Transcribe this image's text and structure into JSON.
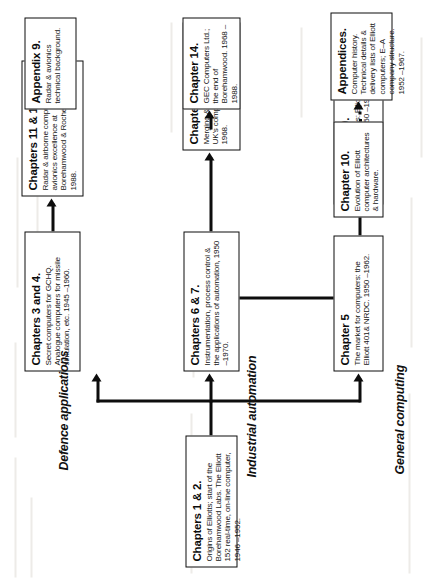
{
  "diagram": {
    "orientation": "rotated-90-ccw",
    "root": {
      "title": "Chapters 1 & 2.",
      "body": "Origins of Elliotts; start of the Borehamwood Labs. The Elliott 152 real-time, on-line computer, 1946 –1952."
    },
    "branches": [
      {
        "key": "defence",
        "label": "Defence applications"
      },
      {
        "key": "industrial",
        "label": "Industrial automation"
      },
      {
        "key": "general",
        "label": "General computing"
      }
    ],
    "boxes": {
      "ch3_4": {
        "title": "Chapters 3 and 4.",
        "body": "Secret computers for GCHQ. Analogue computers for missile simulation, etc. 1945 –1960."
      },
      "ch11_12": {
        "title": "Chapters 11 & 12.",
        "body": "Radar & airborne computing; avionics excellence at Borehamwood & Rochester. 1950 –1988."
      },
      "appendix9": {
        "title": "Appendix 9.",
        "body": "Radar & avionics technical background."
      },
      "ch6_7": {
        "title": "Chapters 6 & 7.",
        "body": "Instrumentation, process control & the applications of automation, 1950 –1970."
      },
      "ch13": {
        "title": "Chapter 13.",
        "body": "Merging & consolidation of the UK's computer industry. 1960 –1968."
      },
      "ch14": {
        "title": "Chapter 14.",
        "body": "GEC Computers Ltd.; the end of Borehamwood. 1968 –1988."
      },
      "ch5": {
        "title": "Chapter 5",
        "body": "The market for computers: the Elliott 401& NRDC. 1950 –1962."
      },
      "ch8_9": {
        "title": "Chapters 8 & 9.",
        "body": "Software & applications: Elliott computers & NCR. 1950 –1968."
      },
      "ch10": {
        "title": "Chapter 10.",
        "body": "Evolution of Elliott computer architectures & hardware."
      },
      "appendices": {
        "title": "Appendices.",
        "body": "Computer history. Technical details & delivery lists of Elliott computers; E–A company structure. 1952 –1967."
      }
    },
    "colors": {
      "stroke": "#0d0d0d",
      "background": "#ffffff",
      "text": "#111111"
    }
  }
}
